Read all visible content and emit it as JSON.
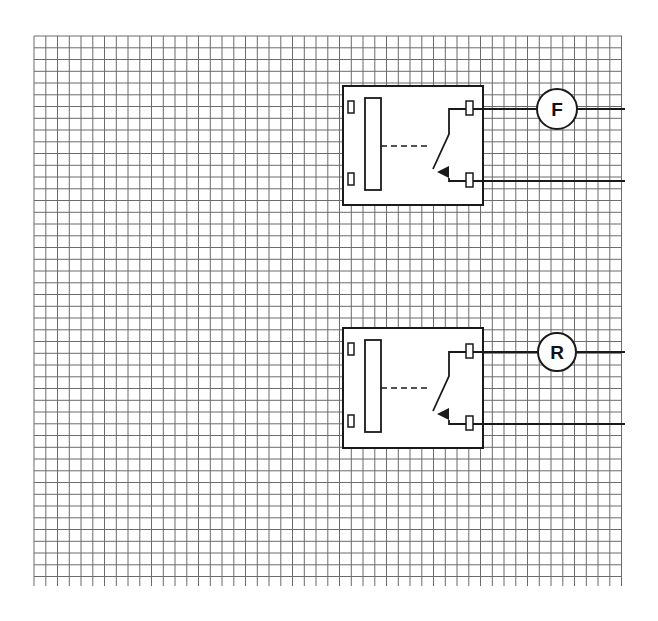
{
  "diagram": {
    "type": "relay-wiring-schematic",
    "background": "#ffffff",
    "grid": {
      "x0": 34,
      "y0": 36,
      "x1": 622,
      "y1": 586,
      "spacing": 11.75,
      "line_color": "#6b6b6b"
    },
    "ink_color": "#1a1a1a",
    "relays": [
      {
        "id": "relay-forward",
        "box": {
          "x": 343,
          "y": 86,
          "w": 140,
          "h": 119
        },
        "coil_label": "",
        "output_label": "F",
        "output_circle": {
          "cx": 557,
          "cy": 109,
          "r": 20
        },
        "wire_top_y": 109,
        "wire_bottom_y": 181
      },
      {
        "id": "relay-reverse",
        "box": {
          "x": 343,
          "y": 328,
          "w": 140,
          "h": 120
        },
        "coil_label": "",
        "output_label": "R",
        "output_circle": {
          "cx": 557,
          "cy": 352,
          "r": 19
        },
        "wire_top_y": 352,
        "wire_bottom_y": 424
      }
    ],
    "wire_end_x": 625
  }
}
